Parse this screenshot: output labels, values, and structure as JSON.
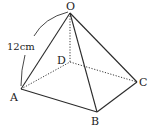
{
  "diagram": {
    "type": "square-pyramid",
    "vertices": {
      "O": {
        "label": "O",
        "x": 70,
        "y": 13
      },
      "A": {
        "label": "A",
        "x": 21,
        "y": 89
      },
      "B": {
        "label": "B",
        "x": 97,
        "y": 112
      },
      "C": {
        "label": "C",
        "x": 137,
        "y": 82
      },
      "D": {
        "label": "D",
        "x": 70,
        "y": 62
      }
    },
    "visible_edges": [
      "OA",
      "OB",
      "OC",
      "AB",
      "BC"
    ],
    "hidden_edges": [
      "OD",
      "AD",
      "DC"
    ],
    "measurement": {
      "edge": "OA",
      "label": "12cm"
    }
  }
}
